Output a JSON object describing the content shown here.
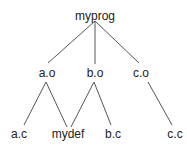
{
  "diagram": {
    "type": "dependency-tree",
    "nodes": [
      {
        "id": "myprog",
        "label": "myprog",
        "x": 95,
        "y": 10
      },
      {
        "id": "ao",
        "label": "a.o",
        "x": 47,
        "y": 67
      },
      {
        "id": "bo",
        "label": "b.o",
        "x": 95,
        "y": 67
      },
      {
        "id": "co",
        "label": "c.o",
        "x": 141,
        "y": 67
      },
      {
        "id": "ac",
        "label": "a.c",
        "x": 19,
        "y": 128
      },
      {
        "id": "mydef",
        "label": "mydef",
        "x": 68,
        "y": 128
      },
      {
        "id": "bc",
        "label": "b.c",
        "x": 113,
        "y": 128
      },
      {
        "id": "cc",
        "label": "c.c",
        "x": 175,
        "y": 128
      }
    ],
    "edges": [
      [
        "myprog",
        "ao"
      ],
      [
        "myprog",
        "bo"
      ],
      [
        "myprog",
        "co"
      ],
      [
        "ao",
        "ac"
      ],
      [
        "ao",
        "mydef"
      ],
      [
        "bo",
        "mydef"
      ],
      [
        "bo",
        "bc"
      ],
      [
        "co",
        "cc"
      ]
    ]
  }
}
